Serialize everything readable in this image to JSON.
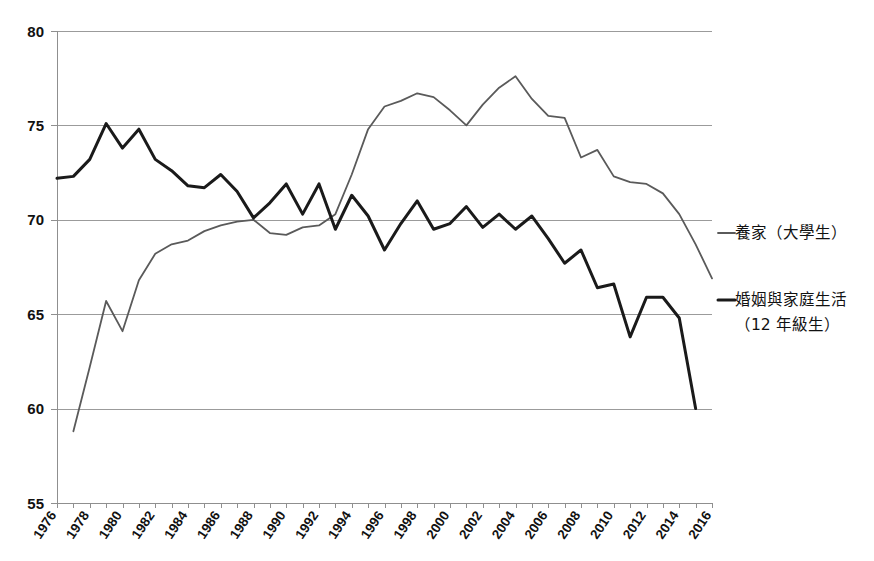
{
  "chart_data": {
    "type": "line",
    "title": "",
    "subtitle": "",
    "xlabel": "",
    "ylabel": "",
    "xlim": [
      1976,
      2016
    ],
    "ylim": [
      55,
      80
    ],
    "ytick_labels": [
      "80",
      "75",
      "70",
      "65",
      "60",
      "55"
    ],
    "yticks": [
      80,
      75,
      70,
      65,
      60,
      55
    ],
    "grid": "horizontal",
    "legend_position": "right",
    "xtick_labels": [
      "1976",
      "1978",
      "1980",
      "1982",
      "1984",
      "1986",
      "1988",
      "1990",
      "1992",
      "1994",
      "1996",
      "1998",
      "2000",
      "2002",
      "2004",
      "2006",
      "2008",
      "2010",
      "2012",
      "2014",
      "2016"
    ],
    "xticks": [
      1976,
      1978,
      1980,
      1982,
      1984,
      1986,
      1988,
      1990,
      1992,
      1994,
      1996,
      1998,
      2000,
      2002,
      2004,
      2006,
      2008,
      2010,
      2012,
      2014,
      2016
    ],
    "x": [
      1976,
      1977,
      1978,
      1979,
      1980,
      1981,
      1982,
      1983,
      1984,
      1985,
      1986,
      1987,
      1988,
      1989,
      1990,
      1991,
      1992,
      1993,
      1994,
      1995,
      1996,
      1997,
      1998,
      1999,
      2000,
      2001,
      2002,
      2003,
      2004,
      2005,
      2006,
      2007,
      2008,
      2009,
      2010,
      2011,
      2012,
      2013,
      2014,
      2015,
      2016
    ],
    "series": [
      {
        "name": "養家（大學生）",
        "color": "#5a5a5a",
        "width": 1.8,
        "x": [
          1977,
          1978,
          1979,
          1980,
          1981,
          1982,
          1983,
          1984,
          1985,
          1986,
          1987,
          1988,
          1989,
          1990,
          1991,
          1992,
          1993,
          1994,
          1995,
          1996,
          1997,
          1998,
          1999,
          2000,
          2001,
          2002,
          2003,
          2004,
          2005,
          2006,
          2007,
          2008,
          2009,
          2010,
          2011,
          2012,
          2013,
          2014,
          2015,
          2016
        ],
        "values": [
          58.8,
          62.2,
          65.7,
          64.1,
          66.8,
          68.2,
          68.7,
          68.9,
          69.4,
          69.7,
          69.9,
          70.0,
          69.3,
          69.2,
          69.6,
          69.7,
          70.3,
          72.4,
          74.8,
          76.0,
          76.3,
          76.7,
          76.5,
          75.8,
          75.0,
          76.1,
          77.0,
          77.6,
          76.4,
          75.5,
          75.4,
          73.3,
          73.7,
          72.3,
          72.0,
          71.9,
          71.4,
          70.3,
          68.7,
          66.9
        ]
      },
      {
        "name": "婚姻與家庭生活（12 年級生）",
        "color": "#1a1a1a",
        "width": 3.0,
        "x": [
          1976,
          1977,
          1978,
          1979,
          1980,
          1981,
          1982,
          1983,
          1984,
          1985,
          1986,
          1987,
          1988,
          1989,
          1990,
          1991,
          1992,
          1993,
          1994,
          1995,
          1996,
          1997,
          1998,
          1999,
          2000,
          2001,
          2002,
          2003,
          2004,
          2005,
          2006,
          2007,
          2008,
          2009,
          2010,
          2011,
          2012,
          2013,
          2014,
          2015
        ],
        "values": [
          72.2,
          72.3,
          73.2,
          75.1,
          73.8,
          74.8,
          73.2,
          72.6,
          71.8,
          71.7,
          72.4,
          71.5,
          70.1,
          70.9,
          71.9,
          70.3,
          71.9,
          69.5,
          71.3,
          70.2,
          68.4,
          69.8,
          71.0,
          69.5,
          69.8,
          70.7,
          69.6,
          70.3,
          69.5,
          70.2,
          69.0,
          67.7,
          68.4,
          66.4,
          66.6,
          63.8,
          65.9,
          65.9,
          64.8,
          60.0
        ]
      }
    ]
  },
  "legend": [
    {
      "label": "養家（大學生）",
      "color": "#5a5a5a",
      "dash_name": "legend-line-gray"
    },
    {
      "label": "婚姻與家庭生活",
      "label2": "（12 年級生）",
      "color": "#1a1a1a",
      "dash_name": "legend-line-black"
    }
  ]
}
